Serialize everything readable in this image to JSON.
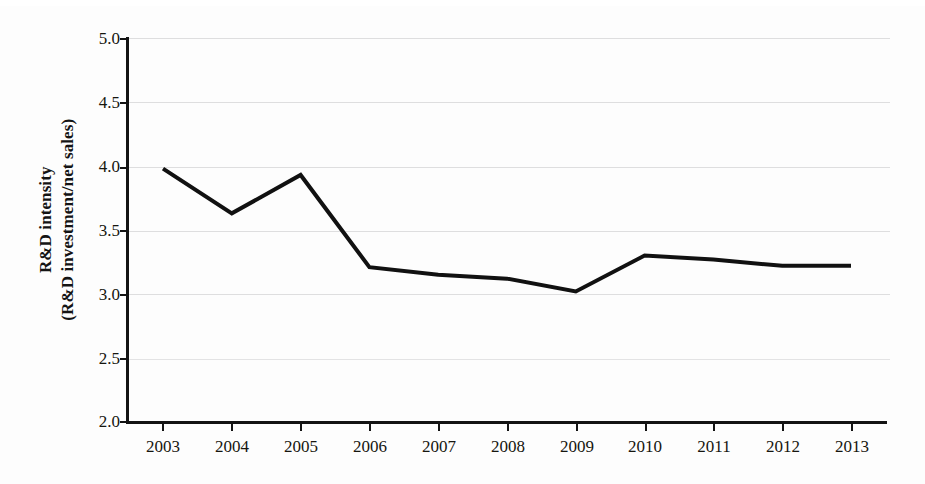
{
  "figure": {
    "background_color": "#fdfdfd",
    "line_color": "#111111",
    "grid_color": "#dededf",
    "axis_color": "#131313"
  },
  "axis_titles": {
    "y_line1": "R&D intensity",
    "y_line2": "(R&D investment/net sales)",
    "x": ""
  },
  "ticks": {
    "y": [
      "5.0",
      "4.5",
      "4.0",
      "3.5",
      "3.0",
      "2.5",
      "2.0"
    ],
    "x": [
      "2003",
      "2004",
      "2005",
      "2006",
      "2007",
      "2008",
      "2009",
      "2010",
      "2011",
      "2012",
      "2013"
    ]
  },
  "chart_data": {
    "type": "line",
    "title": "",
    "subtitle": "",
    "xlabel": "",
    "ylabel": "R&D intensity (R&D investment/net sales)",
    "x": [
      2003,
      2004,
      2005,
      2006,
      2007,
      2008,
      2009,
      2010,
      2011,
      2012,
      2013
    ],
    "categories": [
      "2003",
      "2004",
      "2005",
      "2006",
      "2007",
      "2008",
      "2009",
      "2010",
      "2011",
      "2012",
      "2013"
    ],
    "values": [
      3.98,
      3.63,
      3.93,
      3.21,
      3.15,
      3.12,
      3.02,
      3.3,
      3.27,
      3.22,
      3.22
    ],
    "series": [
      {
        "name": "R&D intensity",
        "values": [
          3.98,
          3.63,
          3.93,
          3.21,
          3.15,
          3.12,
          3.02,
          3.3,
          3.27,
          3.22,
          3.22
        ]
      }
    ],
    "ylim": [
      2.0,
      5.0
    ],
    "ytick_step": 0.5,
    "xlim": [
      2003,
      2013
    ],
    "grid": "horizontal",
    "legend": "none",
    "markers": "none",
    "line_width_px": 4,
    "annotations": []
  }
}
